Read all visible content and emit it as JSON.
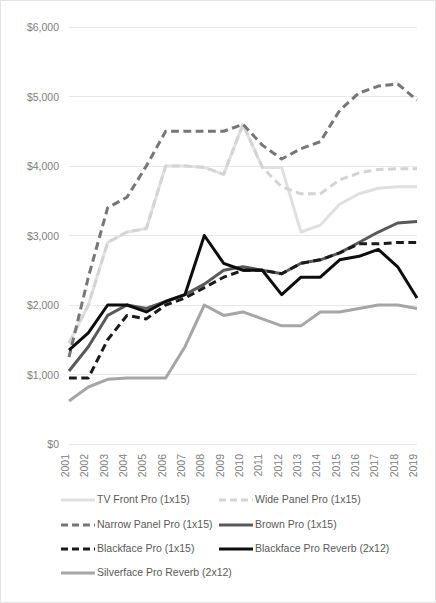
{
  "chart_data": {
    "type": "line",
    "title": "",
    "subtitle": "",
    "xlabel": "",
    "ylabel": "",
    "grid": true,
    "legend_position": "bottom",
    "ylim": [
      0,
      6000
    ],
    "ytick_step": 1000,
    "ytick_labels": [
      "$6,000",
      "$5,000",
      "$4,000",
      "$3,000",
      "$2,000",
      "$1,000",
      "$0"
    ],
    "ytick_values": [
      6000,
      5000,
      4000,
      3000,
      2000,
      1000,
      0
    ],
    "categories": [
      "2001",
      "2002",
      "2003",
      "2004",
      "2005",
      "2006",
      "2007",
      "2008",
      "2009",
      "2010",
      "2011",
      "2012",
      "2013",
      "2014",
      "2015",
      "2016",
      "2017",
      "2018",
      "2019"
    ],
    "x": [
      2001,
      2002,
      2003,
      2004,
      2005,
      2006,
      2007,
      2008,
      2009,
      2010,
      2011,
      2012,
      2013,
      2014,
      2015,
      2016,
      2017,
      2018,
      2019
    ],
    "series": [
      {
        "name": "TV Front Pro (1x15)",
        "color": "#e0e0e0",
        "style": "solid",
        "width": 3,
        "values": [
          1450,
          2000,
          2900,
          3050,
          3100,
          4000,
          4000,
          3980,
          3880,
          4600,
          3980,
          3980,
          3050,
          3150,
          3450,
          3600,
          3680,
          3700,
          3700
        ]
      },
      {
        "name": "Wide Panel Pro (1x15)",
        "color": "#d4d4d4",
        "style": "dashed",
        "width": 3,
        "values": [
          1450,
          2000,
          2900,
          3050,
          3100,
          4000,
          4000,
          3980,
          3880,
          4600,
          3980,
          3700,
          3600,
          3600,
          3800,
          3900,
          3950,
          3960,
          3960
        ]
      },
      {
        "name": "Narrow Panel Pro (1x15)",
        "color": "#767676",
        "style": "dashed",
        "width": 3,
        "values": [
          1250,
          2400,
          3400,
          3550,
          4000,
          4500,
          4500,
          4500,
          4500,
          4600,
          4300,
          4100,
          4250,
          4350,
          4800,
          5050,
          5150,
          5180,
          4950
        ]
      },
      {
        "name": "Brown Pro (1x15)",
        "color": "#595959",
        "style": "solid",
        "width": 3,
        "values": [
          1050,
          1400,
          1850,
          2000,
          1950,
          2050,
          2150,
          2300,
          2500,
          2550,
          2500,
          2450,
          2600,
          2650,
          2750,
          2900,
          3050,
          3180,
          3200
        ]
      },
      {
        "name": "Blackface Pro (1x15)",
        "color": "#1a1a1a",
        "style": "dashed",
        "width": 3,
        "values": [
          950,
          950,
          1500,
          1850,
          1800,
          2000,
          2100,
          2250,
          2400,
          2500,
          2500,
          2450,
          2600,
          2650,
          2750,
          2880,
          2880,
          2900,
          2900
        ]
      },
      {
        "name": "Blackface Pro Reverb (2x12)",
        "color": "#0d0d0d",
        "style": "solid",
        "width": 3,
        "values": [
          1350,
          1600,
          2000,
          2000,
          1900,
          2050,
          2150,
          3000,
          2600,
          2500,
          2500,
          2150,
          2400,
          2400,
          2650,
          2700,
          2800,
          2550,
          2100
        ]
      },
      {
        "name": "Silverface Pro Reverb (2x12)",
        "color": "#a6a6a6",
        "style": "solid",
        "width": 3,
        "values": [
          620,
          820,
          930,
          950,
          950,
          950,
          1400,
          2000,
          1850,
          1900,
          1800,
          1700,
          1700,
          1900,
          1900,
          1950,
          2000,
          2000,
          1950
        ]
      }
    ]
  },
  "legend": {
    "entries": [
      {
        "label": "TV Front Pro (1x15)",
        "color": "#e0e0e0",
        "style": "solid"
      },
      {
        "label": "Wide Panel Pro (1x15)",
        "color": "#d4d4d4",
        "style": "dashed"
      },
      {
        "label": "Narrow Panel Pro (1x15)",
        "color": "#767676",
        "style": "dashed"
      },
      {
        "label": "Brown Pro (1x15)",
        "color": "#595959",
        "style": "solid"
      },
      {
        "label": "Blackface Pro (1x15)",
        "color": "#1a1a1a",
        "style": "dashed"
      },
      {
        "label": "Blackface Pro Reverb (2x12)",
        "color": "#0d0d0d",
        "style": "solid"
      },
      {
        "label": "Silverface Pro Reverb (2x12)",
        "color": "#a6a6a6",
        "style": "solid"
      }
    ]
  },
  "plot_geometry": {
    "left": 68,
    "right": 416,
    "top": 26,
    "bottom": 443
  }
}
